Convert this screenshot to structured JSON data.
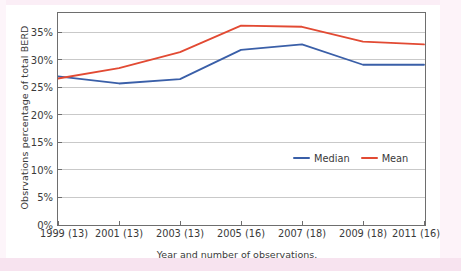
{
  "chart_data": {
    "type": "line",
    "title": "",
    "xlabel": "Year and number of observations.",
    "ylabel": "Obsrvations percentage of total BERD",
    "categories": [
      "1999 (13)",
      "2001 (13)",
      "2003 (13)",
      "2005 (16)",
      "2007 (18)",
      "2009 (18)",
      "2011 (16)"
    ],
    "x_values": [
      1999,
      2001,
      2003,
      2005,
      2007,
      2009,
      2011
    ],
    "observation_counts": [
      13,
      13,
      13,
      16,
      18,
      18,
      16
    ],
    "series": [
      {
        "name": "Median",
        "color": "#3a5fa8",
        "values": [
          27.0,
          25.7,
          26.5,
          31.8,
          32.8,
          29.1,
          29.1
        ]
      },
      {
        "name": "Mean",
        "color": "#e24a33",
        "values": [
          26.6,
          28.5,
          31.4,
          36.2,
          36.0,
          33.3,
          32.8
        ]
      }
    ],
    "ylim": [
      0,
      38.5
    ],
    "yticks": [
      0,
      5,
      10,
      15,
      20,
      25,
      30,
      35
    ],
    "ytick_labels": [
      "0%",
      "5%",
      "10%",
      "15%",
      "20%",
      "25%",
      "30%",
      "35%"
    ],
    "grid": "horizontal",
    "grid_color": "#c9c9c9",
    "legend_position": "center-right-inside",
    "axis_color": "#6e6e6e"
  },
  "legend": {
    "entries": [
      {
        "label": "Median",
        "color": "#3a5fa8"
      },
      {
        "label": "Mean",
        "color": "#e24a33"
      }
    ]
  }
}
